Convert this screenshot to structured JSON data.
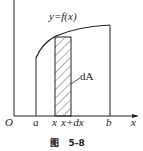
{
  "figure": {
    "curve_label": "y=f(x)",
    "area_label": "dA",
    "origin_label": "O",
    "x_axis_label": "x",
    "tick_labels": {
      "a": "a",
      "x": "x",
      "x_plus_dx": "x+dx",
      "b": "b"
    },
    "caption": "图   5-8",
    "colors": {
      "stroke": "#222222",
      "background": "#ffffff"
    }
  }
}
